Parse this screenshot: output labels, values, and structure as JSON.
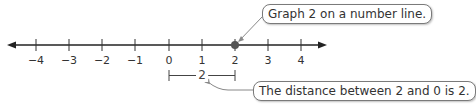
{
  "number_line": {
    "min": -4,
    "max": 4,
    "ticks": [
      {
        "value": -4,
        "label": "−4",
        "x": 36
      },
      {
        "value": -3,
        "label": "−3",
        "x": 69
      },
      {
        "value": -2,
        "label": "−2",
        "x": 102
      },
      {
        "value": -1,
        "label": "−1",
        "x": 135
      },
      {
        "value": 0,
        "label": "0",
        "x": 169
      },
      {
        "value": 1,
        "label": "1",
        "x": 202
      },
      {
        "value": 2,
        "label": "2",
        "x": 235
      },
      {
        "value": 3,
        "label": "3",
        "x": 268
      },
      {
        "value": 4,
        "label": "4",
        "x": 301
      }
    ],
    "graphed_point": {
      "value": 2,
      "color": "#555555"
    },
    "axis_color": "#222222"
  },
  "distance_bracket": {
    "from": 0,
    "to": 2,
    "label": "2"
  },
  "callouts": {
    "top": "Graph 2 on a number line.",
    "bottom": "The distance between 2 and 0 is 2."
  }
}
